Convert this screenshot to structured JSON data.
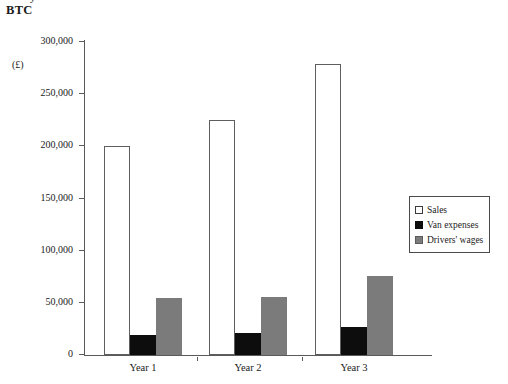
{
  "header": {
    "clipped_top_text": "y",
    "title": "BTC",
    "unit_label": "(£)"
  },
  "legend": {
    "position": "right-middle",
    "items": [
      {
        "label": "Sales",
        "swatch": "white-outlined-square",
        "color": "#ffffff"
      },
      {
        "label": "Van expenses",
        "swatch": "black-filled-square",
        "color": "#0d0d0d"
      },
      {
        "label": "Drivers' wages",
        "swatch": "gray-filled-square",
        "color": "#7b7b7b"
      }
    ]
  },
  "chart_data": {
    "type": "bar",
    "title": "BTC",
    "xlabel": "",
    "ylabel": "(£)",
    "ylim": [
      0,
      300000
    ],
    "ytick_values": [
      0,
      50000,
      100000,
      150000,
      200000,
      250000,
      300000
    ],
    "ytick_labels": [
      "0",
      "50,000",
      "100,000",
      "150,000",
      "200,000",
      "250,000",
      "300,000"
    ],
    "grid": false,
    "legend_position": "right",
    "categories": [
      "Year 1",
      "Year 2",
      "Year 3"
    ],
    "series": [
      {
        "name": "Sales",
        "color": "#ffffff",
        "values": [
          200000,
          225000,
          279000
        ]
      },
      {
        "name": "Van expenses",
        "color": "#0d0d0d",
        "values": [
          19000,
          21000,
          27000
        ]
      },
      {
        "name": "Drivers' wages",
        "color": "#7b7b7b",
        "values": [
          55000,
          55500,
          76000
        ]
      }
    ]
  }
}
